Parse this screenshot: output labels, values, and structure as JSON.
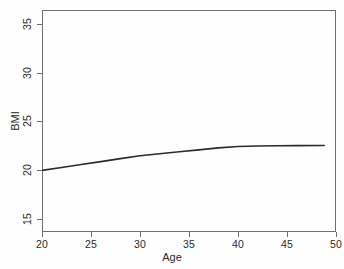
{
  "chart_data": {
    "type": "line",
    "title": "",
    "xlabel": "Age",
    "ylabel": "BMI",
    "xlim": [
      20,
      50
    ],
    "ylim": [
      13.7,
      36.4
    ],
    "xticks": [
      20,
      25,
      30,
      35,
      40,
      45,
      50
    ],
    "yticks": [
      15,
      20,
      25,
      30,
      35
    ],
    "xticklabels": [
      "20",
      "25",
      "30",
      "35",
      "40",
      "45",
      "50"
    ],
    "yticklabels": [
      "15",
      "20",
      "25",
      "30",
      "35"
    ],
    "grid": false,
    "legend": false,
    "line_color": "#2b2b2b",
    "line_width": 1.6,
    "series": [
      {
        "name": "BMI",
        "x": [
          20,
          22,
          24,
          26,
          28,
          30,
          32,
          34,
          36,
          38,
          40,
          42,
          44,
          46,
          48.8
        ],
        "y": [
          20.0,
          20.3,
          20.6,
          20.9,
          21.2,
          21.5,
          21.7,
          21.9,
          22.1,
          22.3,
          22.45,
          22.5,
          22.52,
          22.53,
          22.55
        ]
      }
    ]
  },
  "axes": {
    "x_label": "Age",
    "y_label": "BMI"
  },
  "colors": {
    "frame": "#6f6f6f",
    "text": "#2b2b2b",
    "background": "#fefefe",
    "line": "#2b2b2b"
  }
}
